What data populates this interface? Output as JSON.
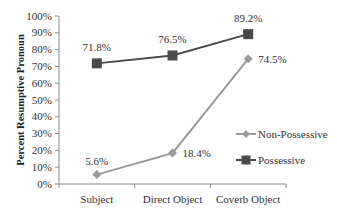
{
  "chart_data": {
    "type": "line",
    "title": "",
    "xlabel": "",
    "ylabel": "Percent Resumptive Pronoun",
    "categories": [
      "Subject",
      "Direct Object",
      "Coverb Object"
    ],
    "series": [
      {
        "name": "Non-Possessive",
        "values": [
          5.6,
          18.4,
          74.5
        ],
        "labels": [
          "5.6%",
          "18.4%",
          "74.5%"
        ],
        "color": "#9a9a9a",
        "marker": "diamond"
      },
      {
        "name": "Possessive",
        "values": [
          71.8,
          76.5,
          89.2
        ],
        "labels": [
          "71.8%",
          "76.5%",
          "89.2%"
        ],
        "color": "#4a4a4a",
        "marker": "square"
      }
    ],
    "ylim": [
      0,
      100
    ],
    "yticks": [
      "0%",
      "10%",
      "20%",
      "30%",
      "40%",
      "50%",
      "60%",
      "70%",
      "80%",
      "90%",
      "100%"
    ],
    "grid": false,
    "legend_position": "right"
  }
}
